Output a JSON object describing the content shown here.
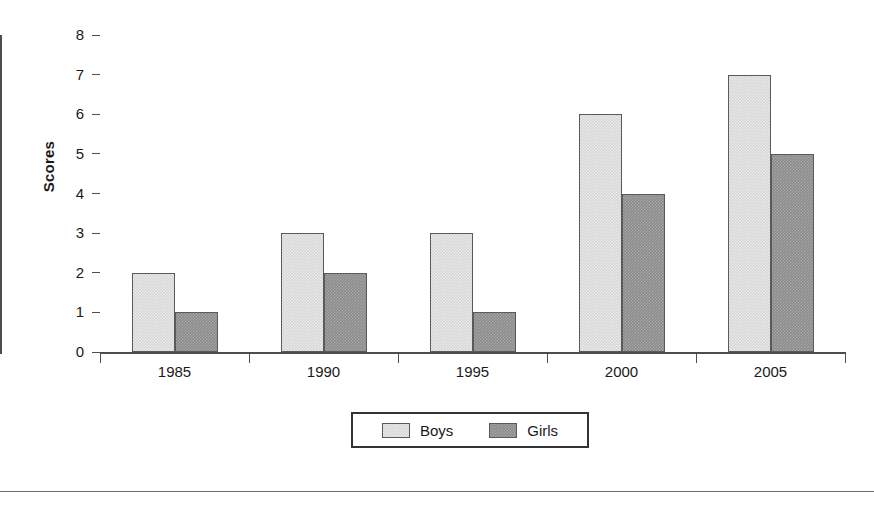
{
  "chart_data": {
    "type": "bar",
    "title": "",
    "subtitle": "",
    "xlabel": "",
    "ylabel": "Scores",
    "categories": [
      "1985",
      "1990",
      "1995",
      "2000",
      "2005"
    ],
    "series": [
      {
        "name": "Boys",
        "color": "#d5d5d5",
        "values": [
          2,
          3,
          3,
          6,
          7
        ]
      },
      {
        "name": "Girls",
        "color": "#8b8b8b",
        "values": [
          1,
          2,
          1,
          4,
          5
        ]
      }
    ],
    "ylim": [
      0,
      8
    ],
    "ytick_step": 1,
    "yticks": [
      "8",
      "7",
      "6",
      "5",
      "4",
      "3",
      "2",
      "1",
      "0"
    ],
    "grid": false,
    "legend_position": "bottom-center",
    "axis_color": "#4d4d4d",
    "bar_border_color": "#5a5a5a",
    "legend_border_color": "#333333"
  },
  "legend": {
    "entries": [
      {
        "label": "Boys"
      },
      {
        "label": "Girls"
      }
    ]
  }
}
